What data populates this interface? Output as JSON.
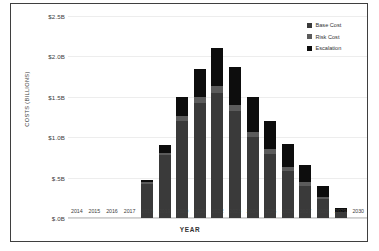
{
  "chart_data": {
    "type": "bar",
    "subtype": "stacked-column",
    "title": "",
    "xlabel": "YEAR",
    "ylabel": "COSTS (BILLIONS)",
    "ylim": [
      0,
      2.5
    ],
    "ytick_labels": [
      "$2.5B",
      "$2.0B",
      "$1.5B",
      "$1.0B",
      "$.5B",
      "$.0B"
    ],
    "ytick_values": [
      2.5,
      2.0,
      1.5,
      1.0,
      0.5,
      0.0
    ],
    "grid": true,
    "legend_position": "top-right",
    "categories": [
      "2014",
      "2015",
      "2016",
      "2017",
      "2018",
      "2019",
      "2020",
      "2021",
      "2022",
      "2023",
      "2024",
      "2025",
      "2026",
      "2027",
      "2028",
      "2029",
      "2030"
    ],
    "series": [
      {
        "name": "Base Cost",
        "color": "#3a3a3a",
        "values": [
          0,
          0,
          0,
          0,
          0.42,
          0.78,
          1.2,
          1.42,
          1.55,
          1.32,
          1.0,
          0.79,
          0.58,
          0.4,
          0.23,
          0.07,
          0
        ]
      },
      {
        "name": "Risk Cost",
        "color": "#5b5b5b",
        "values": [
          0,
          0,
          0,
          0,
          0.02,
          0.03,
          0.06,
          0.08,
          0.09,
          0.08,
          0.07,
          0.06,
          0.05,
          0.04,
          0.03,
          0.01,
          0
        ]
      },
      {
        "name": "Escalation",
        "color": "#0d0d0d",
        "values": [
          0,
          0,
          0,
          0,
          0.03,
          0.09,
          0.24,
          0.35,
          0.46,
          0.47,
          0.43,
          0.35,
          0.29,
          0.22,
          0.14,
          0.05,
          0
        ]
      }
    ],
    "totals": [
      0,
      0,
      0,
      0,
      0.47,
      0.9,
      1.5,
      1.85,
      2.1,
      1.87,
      1.5,
      1.2,
      0.92,
      0.66,
      0.4,
      0.13,
      0
    ]
  },
  "legend": {
    "items": [
      {
        "label": "Base Cost",
        "color": "#3a3a3a"
      },
      {
        "label": "Risk Cost",
        "color": "#5b5b5b"
      },
      {
        "label": "Escalation",
        "color": "#0d0d0d"
      }
    ]
  },
  "axes": {
    "x_title": "YEAR",
    "y_title": "COSTS (BILLIONS)"
  }
}
